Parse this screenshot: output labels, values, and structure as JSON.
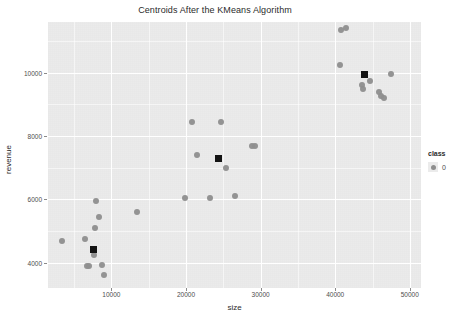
{
  "chart_data": {
    "type": "scatter",
    "title": "Centroids After the KMeans Algorithm",
    "xlabel": "size",
    "ylabel": "revenue",
    "xlim": [
      1500,
      51500
    ],
    "ylim": [
      3200,
      11600
    ],
    "grid": true,
    "xticks": [
      10000,
      20000,
      30000,
      40000,
      50000
    ],
    "yticks": [
      4000,
      6000,
      8000,
      10000
    ],
    "xtick_labels": [
      "10000",
      "20000",
      "30000",
      "40000",
      "50000"
    ],
    "ytick_labels": [
      "4000",
      "6000",
      "8000",
      "10000"
    ],
    "legend": {
      "title": "class",
      "position": "right",
      "entries": [
        {
          "label": "0",
          "color": "#8e8e8e",
          "marker": "circle"
        }
      ]
    },
    "series": [
      {
        "name": "observations",
        "marker": "circle",
        "color": "#8e8e8e",
        "points": [
          {
            "x": 3400,
            "y": 4700
          },
          {
            "x": 6400,
            "y": 4750
          },
          {
            "x": 6700,
            "y": 3880
          },
          {
            "x": 7000,
            "y": 3880
          },
          {
            "x": 7600,
            "y": 4250
          },
          {
            "x": 7800,
            "y": 5100
          },
          {
            "x": 8000,
            "y": 5950
          },
          {
            "x": 8400,
            "y": 5450
          },
          {
            "x": 8700,
            "y": 3940
          },
          {
            "x": 9000,
            "y": 3600
          },
          {
            "x": 13400,
            "y": 5600
          },
          {
            "x": 19900,
            "y": 6050
          },
          {
            "x": 20800,
            "y": 8450
          },
          {
            "x": 21500,
            "y": 7400
          },
          {
            "x": 23200,
            "y": 6050
          },
          {
            "x": 24700,
            "y": 8450
          },
          {
            "x": 25400,
            "y": 7000
          },
          {
            "x": 26500,
            "y": 6100
          },
          {
            "x": 28800,
            "y": 7700
          },
          {
            "x": 29300,
            "y": 7700
          },
          {
            "x": 40800,
            "y": 11350
          },
          {
            "x": 41400,
            "y": 11400
          },
          {
            "x": 40600,
            "y": 10250
          },
          {
            "x": 43600,
            "y": 9600
          },
          {
            "x": 43700,
            "y": 9500
          },
          {
            "x": 44700,
            "y": 9750
          },
          {
            "x": 45900,
            "y": 9400
          },
          {
            "x": 46200,
            "y": 9250
          },
          {
            "x": 46600,
            "y": 9200
          },
          {
            "x": 47500,
            "y": 9950
          }
        ]
      },
      {
        "name": "centroids",
        "marker": "square",
        "color": "#141414",
        "points": [
          {
            "x": 7550,
            "y": 4430
          },
          {
            "x": 24300,
            "y": 7280
          },
          {
            "x": 43900,
            "y": 9950
          }
        ]
      }
    ]
  }
}
